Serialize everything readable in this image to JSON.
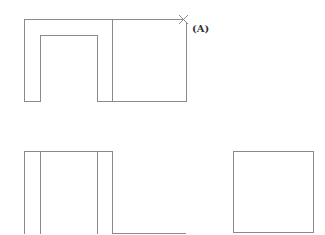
{
  "diagram": {
    "type": "orthographic-projection",
    "line_color": "#8a8a8a",
    "views": [
      {
        "name": "top-view",
        "description": "U-shaped block with attached square block",
        "point_marker": {
          "symbol": "×",
          "label": "(A)",
          "x": 183,
          "y": 19
        }
      },
      {
        "name": "front-view",
        "description": "rectangle with inner vertical lines and extension baseline"
      },
      {
        "name": "side-view",
        "description": "square"
      }
    ],
    "marker_label": "(A)"
  }
}
